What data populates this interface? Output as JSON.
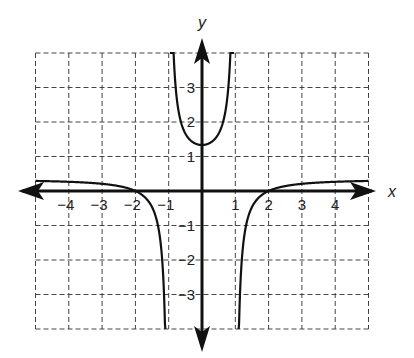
{
  "chart_data": {
    "type": "line",
    "title": "",
    "xlabel": "x",
    "ylabel": "y",
    "xlim": [
      -5,
      5
    ],
    "ylim": [
      -4,
      4
    ],
    "grid": true,
    "grid_style": "dashed",
    "x_ticks": [
      "-4",
      "-3",
      "-2",
      "-1",
      "1",
      "2",
      "3",
      "4"
    ],
    "y_ticks": [
      "3",
      "2",
      "1",
      "-1",
      "-2",
      "-3"
    ],
    "vertical_asymptotes": [
      -1,
      1
    ],
    "horizontal_asymptote": 0.33,
    "series": [
      {
        "name": "f(x) left branch",
        "x": [
          -5,
          -4,
          -3,
          -2.5,
          -2,
          -1.6,
          -1.3,
          -1.15,
          -1.1
        ],
        "y": [
          0.29,
          0.27,
          0.21,
          0.14,
          0.0,
          -0.27,
          -0.75,
          -1.6,
          -4.0
        ]
      },
      {
        "name": "f(x) middle branch",
        "x": [
          -0.97,
          -0.9,
          -0.75,
          -0.5,
          0,
          0.5,
          0.75,
          0.9,
          0.97
        ],
        "y": [
          4.0,
          3.0,
          2.1,
          1.67,
          1.33,
          1.67,
          2.1,
          3.0,
          4.0
        ]
      },
      {
        "name": "f(x) right branch",
        "x": [
          1.1,
          1.15,
          1.3,
          1.6,
          2,
          2.5,
          3,
          4,
          5
        ],
        "y": [
          -4.0,
          -1.6,
          -0.75,
          -0.27,
          0.0,
          0.14,
          0.21,
          0.27,
          0.29
        ]
      }
    ]
  }
}
